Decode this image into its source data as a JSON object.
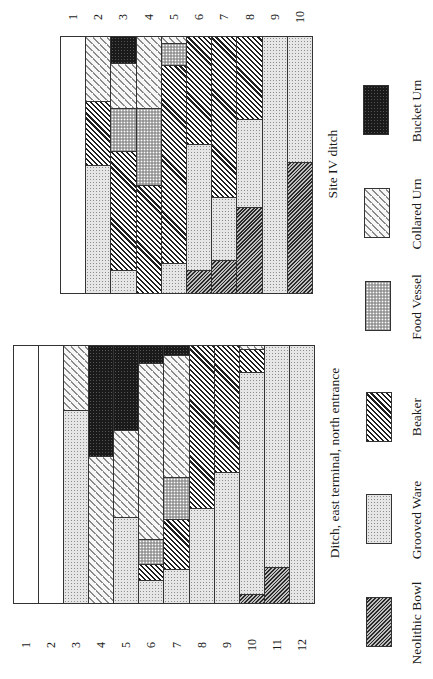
{
  "chart_data": [
    {
      "type": "bar",
      "stacked": true,
      "orientation": "rotated 90deg (horizontal stacked bars, figure printed sideways)",
      "title": "Site IV ditch",
      "categories": [
        "1",
        "2",
        "3",
        "4",
        "5",
        "6",
        "7",
        "8",
        "9",
        "10"
      ],
      "units": "percent of assemblage (estimated)",
      "series_order": [
        "Bucket Urn",
        "Collared Urn",
        "Food Vessel",
        "Beaker",
        "Grooved Ware",
        "Neolithic Bowl"
      ],
      "rows": [
        {
          "label": "1",
          "segments": []
        },
        {
          "label": "2",
          "segments": [
            {
              "type": "Collared Urn",
              "value": 25.2
            },
            {
              "type": "Beaker",
              "value": 25.2
            },
            {
              "type": "Grooved Ware",
              "value": 49.6
            }
          ]
        },
        {
          "label": "3",
          "segments": [
            {
              "type": "Bucket Urn",
              "value": 10.5
            },
            {
              "type": "Collared Urn",
              "value": 17.8
            },
            {
              "type": "Food Vessel",
              "value": 16.7
            },
            {
              "type": "Beaker",
              "value": 46.5
            },
            {
              "type": "Grooved Ware",
              "value": 8.5
            }
          ]
        },
        {
          "label": "4",
          "segments": [
            {
              "type": "Collared Urn",
              "value": 28.3
            },
            {
              "type": "Food Vessel",
              "value": 29.8
            },
            {
              "type": "Beaker",
              "value": 41.9
            }
          ]
        },
        {
          "label": "5",
          "segments": [
            {
              "type": "Collared Urn",
              "value": 2.7
            },
            {
              "type": "Food Vessel",
              "value": 8.5
            },
            {
              "type": "Beaker",
              "value": 77.5
            },
            {
              "type": "Grooved Ware",
              "value": 11.3
            }
          ]
        },
        {
          "label": "6",
          "segments": [
            {
              "type": "Beaker",
              "value": 42.2
            },
            {
              "type": "Grooved Ware",
              "value": 49.3
            },
            {
              "type": "Neolithic Bowl",
              "value": 8.5
            }
          ]
        },
        {
          "label": "7",
          "segments": [
            {
              "type": "Beaker",
              "value": 62.8
            },
            {
              "type": "Grooved Ware",
              "value": 24.8
            },
            {
              "type": "Neolithic Bowl",
              "value": 12.4
            }
          ]
        },
        {
          "label": "8",
          "segments": [
            {
              "type": "Beaker",
              "value": 32.6
            },
            {
              "type": "Grooved Ware",
              "value": 34.1
            },
            {
              "type": "Neolithic Bowl",
              "value": 33.3
            }
          ]
        },
        {
          "label": "9",
          "segments": [
            {
              "type": "Grooved Ware",
              "value": 100
            }
          ]
        },
        {
          "label": "10",
          "segments": [
            {
              "type": "Grooved Ware",
              "value": 49.2
            },
            {
              "type": "Neolithic Bowl",
              "value": 50.8
            }
          ]
        }
      ]
    },
    {
      "type": "bar",
      "stacked": true,
      "orientation": "rotated 90deg (horizontal stacked bars, figure printed sideways)",
      "title": "Ditch, east terminal, north entrance",
      "categories": [
        "1",
        "2",
        "3",
        "4",
        "5",
        "6",
        "7",
        "8",
        "9",
        "10",
        "11",
        "12"
      ],
      "units": "percent of assemblage (estimated)",
      "series_order": [
        "Bucket Urn",
        "Collared Urn",
        "Food Vessel",
        "Beaker",
        "Grooved Ware",
        "Neolithic Bowl"
      ],
      "rows": [
        {
          "label": "1",
          "segments": []
        },
        {
          "label": "2",
          "segments": []
        },
        {
          "label": "3",
          "segments": [
            {
              "type": "Collared Urn",
              "value": 25.1
            },
            {
              "type": "Grooved Ware",
              "value": 74.9
            }
          ]
        },
        {
          "label": "4",
          "segments": [
            {
              "type": "Bucket Urn",
              "value": 43.2
            },
            {
              "type": "Collared Urn",
              "value": 56.8
            }
          ]
        },
        {
          "label": "5",
          "segments": [
            {
              "type": "Bucket Urn",
              "value": 33.2
            },
            {
              "type": "Collared Urn",
              "value": 33.6
            },
            {
              "type": "Grooved Ware",
              "value": 33.2
            }
          ]
        },
        {
          "label": "6",
          "segments": [
            {
              "type": "Bucket Urn",
              "value": 6.9
            },
            {
              "type": "Collared Urn",
              "value": 68.4
            },
            {
              "type": "Food Vessel",
              "value": 10.0
            },
            {
              "type": "Beaker",
              "value": 6.2
            },
            {
              "type": "Grooved Ware",
              "value": 8.5
            }
          ]
        },
        {
          "label": "7",
          "segments": [
            {
              "type": "Bucket Urn",
              "value": 3.9
            },
            {
              "type": "Collared Urn",
              "value": 47.5
            },
            {
              "type": "Food Vessel",
              "value": 16.2
            },
            {
              "type": "Beaker",
              "value": 19.7
            },
            {
              "type": "Grooved Ware",
              "value": 12.7
            }
          ]
        },
        {
          "label": "8",
          "segments": [
            {
              "type": "Beaker",
              "value": 63.3
            },
            {
              "type": "Grooved Ware",
              "value": 36.7
            }
          ]
        },
        {
          "label": "9",
          "segments": [
            {
              "type": "Beaker",
              "value": 49.4
            },
            {
              "type": "Grooved Ware",
              "value": 50.6
            }
          ]
        },
        {
          "label": "10",
          "segments": [
            {
              "type": "Collared Urn",
              "value": 1.5
            },
            {
              "type": "Beaker",
              "value": 8.9
            },
            {
              "type": "Grooved Ware",
              "value": 86.5
            },
            {
              "type": "Neolithic Bowl",
              "value": 3.1
            }
          ]
        },
        {
          "label": "11",
          "segments": [
            {
              "type": "Grooved Ware",
              "value": 86.5
            },
            {
              "type": "Neolithic Bowl",
              "value": 13.5
            }
          ]
        },
        {
          "label": "12",
          "segments": [
            {
              "type": "Grooved Ware",
              "value": 100
            }
          ]
        }
      ]
    }
  ],
  "legend": {
    "position": "right (rotated)",
    "items": [
      {
        "key": "neolithic_bowl",
        "label": "Neolithic Bowl"
      },
      {
        "key": "grooved_ware",
        "label": "Grooved Ware"
      },
      {
        "key": "beaker",
        "label": "Beaker"
      },
      {
        "key": "food_vessel",
        "label": "Food Vessel"
      },
      {
        "key": "collared_urn",
        "label": "Collared Urn"
      },
      {
        "key": "bucket_urn",
        "label": "Bucket Urn"
      }
    ]
  },
  "captions": {
    "upper": "Site IV ditch",
    "lower": "Ditch, east terminal, north entrance"
  }
}
